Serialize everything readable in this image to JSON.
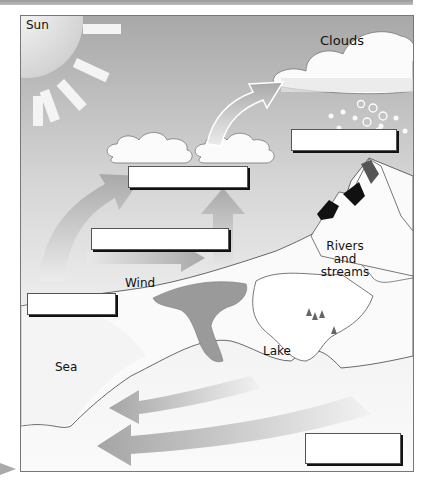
{
  "diagram": {
    "type": "water-cycle",
    "labels": {
      "sun": "Sun",
      "clouds": "Clouds",
      "wind": "Wind",
      "rivers": [
        "Rivers",
        "and",
        "streams"
      ],
      "lake": "Lake",
      "sea": "Sea"
    },
    "answer_boxes": [
      {
        "id": "precipitation-box",
        "value": ""
      },
      {
        "id": "condensation-box",
        "value": ""
      },
      {
        "id": "transpiration-box",
        "value": ""
      },
      {
        "id": "evaporation-box",
        "value": ""
      },
      {
        "id": "runoff-box",
        "value": ""
      }
    ]
  }
}
